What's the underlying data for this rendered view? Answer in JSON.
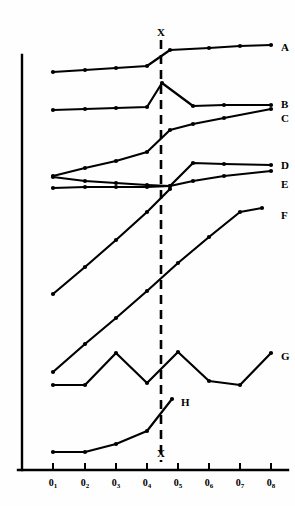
{
  "chart_data": {
    "type": "line",
    "title": "",
    "xlabel": "",
    "ylabel": "",
    "grid": false,
    "legend_position": "right-inline",
    "x_tick_labels": [
      "0₁",
      "0₂",
      "0₃",
      "0₄",
      "0₅",
      "0₆",
      "0₇",
      "0₈"
    ],
    "x_tick_bases": [
      "0",
      "0",
      "0",
      "0",
      "0",
      "0",
      "0",
      "0"
    ],
    "x_tick_subscripts": [
      "1",
      "2",
      "3",
      "4",
      "5",
      "6",
      "7",
      "8"
    ],
    "x_tick_px": [
      53,
      85,
      116,
      147,
      178,
      209,
      240,
      271
    ],
    "axis": {
      "y_axis_x_px": 22,
      "y_axis_top_px": 55,
      "x_axis_y_px": 470,
      "x_axis_left_px": 18,
      "x_axis_right_px": 288,
      "tick_length_px": 7
    },
    "annotations": [
      {
        "name": "vertical-marker-x",
        "label": "X",
        "x_px": 161,
        "y_top_px": 40,
        "y_bottom_px": 462,
        "style": "dashed"
      },
      {
        "name": "marker-label-top",
        "label": "X",
        "x_px": 157,
        "y_px": 27
      },
      {
        "name": "marker-label-bottom",
        "label": "X",
        "x_px": 157,
        "y_px": 448
      }
    ],
    "series": [
      {
        "name": "A",
        "label": "A",
        "label_px": {
          "x": 281,
          "y": 42
        },
        "points_px": [
          [
            53,
            72
          ],
          [
            85,
            70
          ],
          [
            116,
            68
          ],
          [
            147,
            66
          ],
          [
            170,
            50
          ],
          [
            209,
            48
          ],
          [
            240,
            46
          ],
          [
            271,
            45
          ]
        ]
      },
      {
        "name": "B",
        "label": "B",
        "label_px": {
          "x": 281,
          "y": 99
        },
        "points_px": [
          [
            53,
            110
          ],
          [
            85,
            109
          ],
          [
            116,
            108
          ],
          [
            147,
            107
          ],
          [
            162,
            83
          ],
          [
            193,
            106
          ],
          [
            224,
            105
          ],
          [
            271,
            105
          ]
        ]
      },
      {
        "name": "C",
        "label": "C",
        "label_px": {
          "x": 281,
          "y": 113
        },
        "points_px": [
          [
            53,
            176
          ],
          [
            85,
            168
          ],
          [
            116,
            161
          ],
          [
            147,
            152
          ],
          [
            170,
            130
          ],
          [
            193,
            124
          ],
          [
            224,
            118
          ],
          [
            271,
            109
          ]
        ]
      },
      {
        "name": "D",
        "label": "D",
        "label_px": {
          "x": 281,
          "y": 160
        },
        "points_px": [
          [
            53,
            177
          ],
          [
            85,
            181
          ],
          [
            116,
            183
          ],
          [
            147,
            185
          ],
          [
            170,
            186
          ],
          [
            193,
            163
          ],
          [
            224,
            164
          ],
          [
            271,
            165
          ]
        ]
      },
      {
        "name": "E",
        "label": "E",
        "label_px": {
          "x": 281,
          "y": 179
        },
        "points_px": [
          [
            53,
            188
          ],
          [
            85,
            187
          ],
          [
            116,
            187
          ],
          [
            147,
            187
          ],
          [
            170,
            186
          ],
          [
            193,
            181
          ],
          [
            224,
            176
          ],
          [
            271,
            171
          ]
        ]
      },
      {
        "name": "E2",
        "label": "",
        "label_px": {
          "x": 0,
          "y": 0
        },
        "points_px": [
          [
            53,
            294
          ],
          [
            85,
            267
          ],
          [
            116,
            240
          ],
          [
            147,
            212
          ],
          [
            170,
            189
          ]
        ]
      },
      {
        "name": "F",
        "label": "F",
        "label_px": {
          "x": 281,
          "y": 210
        },
        "points_px": [
          [
            53,
            372
          ],
          [
            85,
            344
          ],
          [
            116,
            318
          ],
          [
            147,
            291
          ],
          [
            178,
            263
          ],
          [
            209,
            237
          ],
          [
            240,
            212
          ],
          [
            262,
            208
          ]
        ]
      },
      {
        "name": "G",
        "label": "G",
        "label_px": {
          "x": 281,
          "y": 351
        },
        "points_px": [
          [
            53,
            385
          ],
          [
            85,
            385
          ],
          [
            116,
            353
          ],
          [
            147,
            383
          ],
          [
            178,
            352
          ],
          [
            209,
            381
          ],
          [
            240,
            385
          ],
          [
            271,
            353
          ]
        ]
      },
      {
        "name": "H",
        "label": "H",
        "label_px": {
          "x": 181,
          "y": 397
        },
        "points_px": [
          [
            53,
            452
          ],
          [
            85,
            452
          ],
          [
            116,
            444
          ],
          [
            147,
            431
          ],
          [
            172,
            399
          ]
        ]
      }
    ],
    "colors": {
      "line": "#000000",
      "marker": "#000000",
      "axis": "#000000",
      "background": "#ffffff",
      "text": "#000000"
    }
  }
}
